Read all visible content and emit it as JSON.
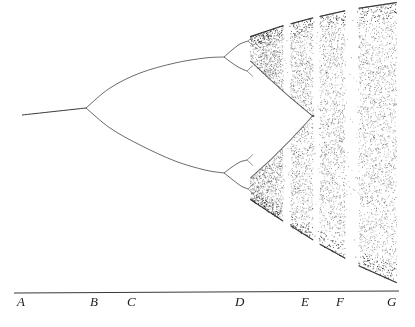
{
  "figure": {
    "background_color": "#ffffff",
    "ink_color": "#1a1a1a"
  },
  "axis": {
    "name": "parameter-axis",
    "line": {
      "x1": 14,
      "y1": 293,
      "x2": 399,
      "y2": 291
    },
    "labels": [
      {
        "text": "A",
        "x": 17,
        "y": 295
      },
      {
        "text": "B",
        "x": 90,
        "y": 295
      },
      {
        "text": "C",
        "x": 127,
        "y": 295
      },
      {
        "text": "D",
        "x": 235,
        "y": 295
      },
      {
        "text": "E",
        "x": 301,
        "y": 295
      },
      {
        "text": "F",
        "x": 336,
        "y": 295
      },
      {
        "text": "G",
        "x": 387,
        "y": 295
      }
    ]
  },
  "chart_data": {
    "type": "line",
    "xlabel": "",
    "ylabel": "",
    "grid": false,
    "legend": null,
    "xlim": [
      14,
      399
    ],
    "ylim": [
      0,
      291
    ],
    "annotations": [
      "A",
      "B",
      "C",
      "D",
      "E",
      "F",
      "G"
    ],
    "fixed_point_stem": {
      "from": [
        22,
        115
      ],
      "to": [
        86,
        108
      ]
    },
    "bifurcation_points": [
      {
        "label": "period-1 to period-2",
        "x": 86,
        "y": 108
      },
      {
        "label": "period-2 to period-4 (upper)",
        "x": 224,
        "y": 57
      },
      {
        "label": "period-2 to period-4 (lower)",
        "x": 224,
        "y": 173
      },
      {
        "label": "period-4 to period-8 (upper-upper)",
        "x": 248,
        "y": 41
      },
      {
        "label": "period-4 to period-8 (upper-lower)",
        "x": 247,
        "y": 71
      },
      {
        "label": "period-4 to period-8 (lower-upper)",
        "x": 247,
        "y": 160
      },
      {
        "label": "period-4 to period-8 (lower-lower)",
        "x": 248,
        "y": 189
      }
    ],
    "branches": [
      {
        "name": "upper-2cycle",
        "path": [
          [
            86,
            108
          ],
          [
            110,
            88
          ],
          [
            140,
            73
          ],
          [
            175,
            63
          ],
          [
            205,
            58
          ],
          [
            224,
            57
          ]
        ]
      },
      {
        "name": "lower-2cycle",
        "path": [
          [
            86,
            108
          ],
          [
            110,
            128
          ],
          [
            140,
            145
          ],
          [
            175,
            161
          ],
          [
            205,
            170
          ],
          [
            224,
            173
          ]
        ]
      },
      {
        "name": "upper-4cycle-a",
        "path": [
          [
            224,
            57
          ],
          [
            232,
            50
          ],
          [
            240,
            44
          ],
          [
            248,
            41
          ]
        ]
      },
      {
        "name": "upper-4cycle-b",
        "path": [
          [
            224,
            57
          ],
          [
            232,
            63
          ],
          [
            240,
            68
          ],
          [
            247,
            71
          ]
        ]
      },
      {
        "name": "lower-4cycle-a",
        "path": [
          [
            224,
            173
          ],
          [
            232,
            167
          ],
          [
            240,
            162
          ],
          [
            247,
            160
          ]
        ]
      },
      {
        "name": "lower-4cycle-b",
        "path": [
          [
            224,
            173
          ],
          [
            233,
            180
          ],
          [
            241,
            186
          ],
          [
            248,
            189
          ]
        ]
      }
    ],
    "chaos_region": {
      "onset_x": 250,
      "end_x": 396,
      "upper_envelope": [
        [
          250,
          36
        ],
        [
          280,
          26
        ],
        [
          310,
          18
        ],
        [
          350,
          9
        ],
        [
          396,
          2
        ]
      ],
      "lower_envelope": [
        [
          250,
          200
        ],
        [
          285,
          223
        ],
        [
          320,
          245
        ],
        [
          360,
          267
        ],
        [
          396,
          283
        ]
      ],
      "inner_gap": {
        "upper": [
          [
            250,
            61
          ],
          [
            268,
            78
          ],
          [
            288,
            96
          ],
          [
            300,
            106
          ],
          [
            312,
            116
          ]
        ],
        "lower": [
          [
            250,
            178
          ],
          [
            270,
            160
          ],
          [
            290,
            140
          ],
          [
            305,
            124
          ],
          [
            312,
            116
          ]
        ]
      },
      "periodic_windows": [
        {
          "name": "window-1",
          "x_start": 283,
          "x_end": 290
        },
        {
          "name": "window-2",
          "x_start": 313,
          "x_end": 319
        },
        {
          "name": "window-3",
          "x_start": 345,
          "x_end": 358
        }
      ]
    }
  }
}
